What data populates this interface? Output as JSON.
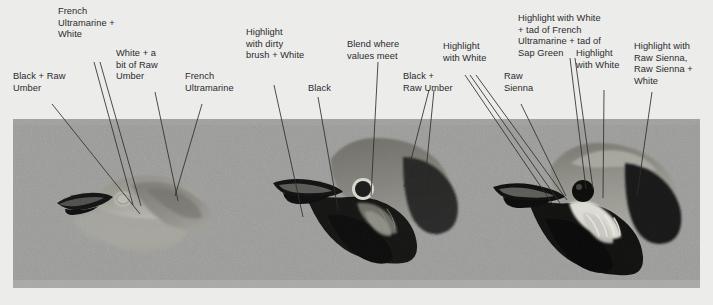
{
  "figure": {
    "background_color": "#ececeb",
    "panel_color": "#9c9c9a",
    "leader_color": "#2e2e2e",
    "text_color": "#2b2b2b"
  },
  "panel": {
    "caption": "",
    "stages": [
      {
        "name": "stage-1-underpainting",
        "description": "Pale blocked-in bird head, light washes only, black beak"
      },
      {
        "name": "stage-2-midtones",
        "description": "Dark body blocked in, unpainted white eye circle reserved"
      },
      {
        "name": "stage-3-finished",
        "description": "Finished head with black eye, white eye ring and highlights"
      }
    ]
  },
  "labels": [
    {
      "id": "label-black-raw-umber-1",
      "text": "Black + Raw\nUmber"
    },
    {
      "id": "label-french-ultramarine-white",
      "text": "French\nUltramarine +\nWhite"
    },
    {
      "id": "label-white-bit-raw-umber",
      "text": "White + a\nbit of Raw\nUmber"
    },
    {
      "id": "label-french-ultramarine",
      "text": "French\nUltramarine"
    },
    {
      "id": "label-highlight-dirty-brush-white",
      "text": "Highlight\nwith dirty\nbrush + White"
    },
    {
      "id": "label-black-1",
      "text": "Black"
    },
    {
      "id": "label-blend-where-values-meet",
      "text": "Blend where\nvalues meet"
    },
    {
      "id": "label-black-raw-umber-2",
      "text": "Black +\nRaw Umber"
    },
    {
      "id": "label-highlight-with-white-1",
      "text": "Highlight\nwith  White"
    },
    {
      "id": "label-raw-sienna",
      "text": "Raw\nSienna"
    },
    {
      "id": "label-highlight-white-ultramarine-sap-green",
      "text": "Highlight with White\n+ tad of French\nUltramarine + tad of\nSap Green"
    },
    {
      "id": "label-highlight-with-white-2",
      "text": "Highlight\nwith White"
    },
    {
      "id": "label-highlight-raw-sienna-white",
      "text": "Highlight with\nRaw Sienna,\nRaw Sienna +\nWhite"
    }
  ]
}
